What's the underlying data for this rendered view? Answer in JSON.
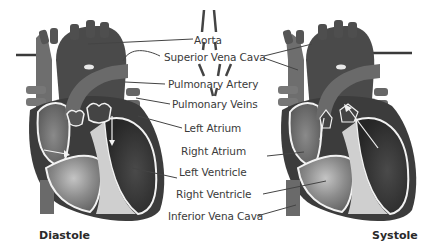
{
  "diagram": {
    "colors": {
      "background": "#ffffff",
      "heart_dark": "#3e3e3e",
      "heart_mid": "#5a5a5a",
      "heart_light": "#8a8a8a",
      "chamber_highlight": "#b9b9b9",
      "vessel": "#6b6b6b",
      "outline": "#f2f2f2",
      "leader_line": "#444444",
      "label_text": "#3a3a3a"
    },
    "labels": [
      {
        "id": "aorta",
        "text": "Aorta"
      },
      {
        "id": "superior-vena-cava",
        "text": "Superior Vena Cava"
      },
      {
        "id": "pulmonary-artery",
        "text": "Pulmonary Artery"
      },
      {
        "id": "pulmonary-veins",
        "text": "Pulmonary Veins"
      },
      {
        "id": "left-atrium",
        "text": "Left Atrium"
      },
      {
        "id": "right-atrium",
        "text": "Right Atrium"
      },
      {
        "id": "left-ventricle",
        "text": "Left Ventricle"
      },
      {
        "id": "right-ventricle",
        "text": "Right Ventricle"
      },
      {
        "id": "inferior-vena-cava",
        "text": "Inferior Vena Cava"
      }
    ],
    "panels": [
      {
        "id": "diastole",
        "title": "Diastole"
      },
      {
        "id": "systole",
        "title": "Systole"
      }
    ]
  }
}
